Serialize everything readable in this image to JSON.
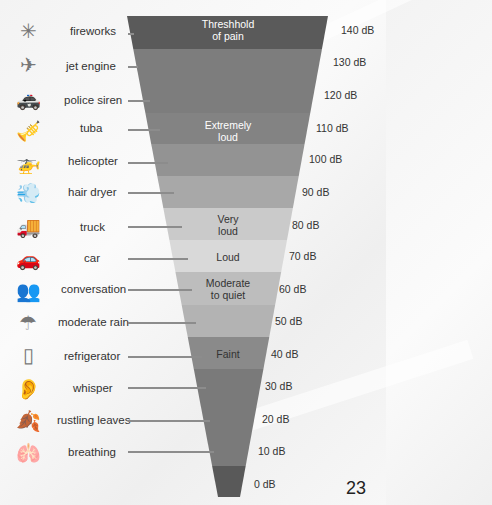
{
  "chart_data": {
    "type": "funnel",
    "title": "",
    "levels": [
      {
        "db": "140 dB",
        "source": "fireworks",
        "category": "Threshhold of pain",
        "color": "#5a5a5a"
      },
      {
        "db": "130 dB",
        "source": "jet engine",
        "category": "",
        "color": "#7d7d7d"
      },
      {
        "db": "120 dB",
        "source": "police siren",
        "category": "",
        "color": "#7d7d7d"
      },
      {
        "db": "110 dB",
        "source": "tuba",
        "category": "Extremely loud",
        "color": "#838383"
      },
      {
        "db": "100 dB",
        "source": "helicopter",
        "category": "",
        "color": "#939393"
      },
      {
        "db": "90 dB",
        "source": "hair dryer",
        "category": "",
        "color": "#a8a8a8"
      },
      {
        "db": "80 dB",
        "source": "truck",
        "category": "Very loud",
        "color": "#cacaca"
      },
      {
        "db": "70 dB",
        "source": "car",
        "category": "Loud",
        "color": "#d9d9d9"
      },
      {
        "db": "60 dB",
        "source": "conversation",
        "category": "Moderate to quiet",
        "color": "#bdbdbd"
      },
      {
        "db": "50 dB",
        "source": "moderate rain",
        "category": "",
        "color": "#b3b3b3"
      },
      {
        "db": "40 dB",
        "source": "refrigerator",
        "category": "Faint",
        "color": "#8a8a8a"
      },
      {
        "db": "30 dB",
        "source": "whisper",
        "category": "",
        "color": "#7a7a7a"
      },
      {
        "db": "20 dB",
        "source": "rustling leaves",
        "category": "",
        "color": "#7a7a7a"
      },
      {
        "db": "10 dB",
        "source": "breathing",
        "category": "",
        "color": "#7a7a7a"
      },
      {
        "db": "0 dB",
        "source": "",
        "category": "",
        "color": "#595959"
      }
    ]
  },
  "sources": [
    {
      "label": "fireworks",
      "icon": "fireworks-icon",
      "glyph": "✳"
    },
    {
      "label": "jet engine",
      "icon": "airplane-icon",
      "glyph": "✈"
    },
    {
      "label": "police siren",
      "icon": "police-car-icon",
      "glyph": "🚓"
    },
    {
      "label": "tuba",
      "icon": "tuba-player-icon",
      "glyph": "🎺"
    },
    {
      "label": "helicopter",
      "icon": "helicopter-icon",
      "glyph": "🚁"
    },
    {
      "label": "hair dryer",
      "icon": "hair-dryer-icon",
      "glyph": "💨"
    },
    {
      "label": "truck",
      "icon": "truck-icon",
      "glyph": "🚚"
    },
    {
      "label": "car",
      "icon": "car-icon",
      "glyph": "🚗"
    },
    {
      "label": "conversation",
      "icon": "people-talking-icon",
      "glyph": "👥"
    },
    {
      "label": "moderate rain",
      "icon": "umbrella-icon",
      "glyph": "☂"
    },
    {
      "label": "refrigerator",
      "icon": "refrigerator-icon",
      "glyph": "▯"
    },
    {
      "label": "whisper",
      "icon": "whisper-icon",
      "glyph": "👂"
    },
    {
      "label": "rustling leaves",
      "icon": "leaves-icon",
      "glyph": "🍂"
    },
    {
      "label": "breathing",
      "icon": "lungs-icon",
      "glyph": "🫁"
    }
  ],
  "categories": {
    "pain": "Threshhold\nof pain",
    "extremely_loud": "Extremely\nloud",
    "very_loud": "Very\nloud",
    "loud": "Loud",
    "moderate": "Moderate\nto quiet",
    "faint": "Faint"
  },
  "db_labels": [
    "140 dB",
    "130 dB",
    "120 dB",
    "110 dB",
    "100 dB",
    "90 dB",
    "80 dB",
    "70 dB",
    "60 dB",
    "50 dB",
    "40 dB",
    "30 dB",
    "20 dB",
    "10 dB",
    "0 dB"
  ],
  "page_number": "23"
}
